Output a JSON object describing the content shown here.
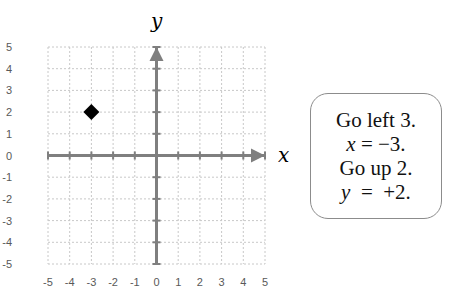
{
  "chart_data": {
    "type": "scatter",
    "title": "",
    "xlabel": "x",
    "ylabel": "y",
    "xlim": [
      -5,
      5
    ],
    "ylim": [
      -5,
      5
    ],
    "x_ticks": [
      "-5",
      "-4",
      "-3",
      "-2",
      "-1",
      "0",
      "1",
      "2",
      "3",
      "4",
      "5"
    ],
    "y_ticks": [
      "5",
      "4",
      "3",
      "2",
      "1",
      "0",
      "-1",
      "-2",
      "-3",
      "-4",
      "-5"
    ],
    "grid": true,
    "points": [
      {
        "x": -3,
        "y": 2,
        "marker": "diamond",
        "color": "#000000"
      }
    ]
  },
  "axes": {
    "x_label": "x",
    "y_label": "y",
    "color": "#7f7f7f",
    "grid_color": "#c8c8c8"
  },
  "callout": {
    "lines": [
      {
        "text": "Go left 3."
      },
      {
        "var": "x",
        "rest": " = −3."
      },
      {
        "text": "Go up 2."
      },
      {
        "var": "y",
        "rest": "  =  +2."
      }
    ]
  }
}
